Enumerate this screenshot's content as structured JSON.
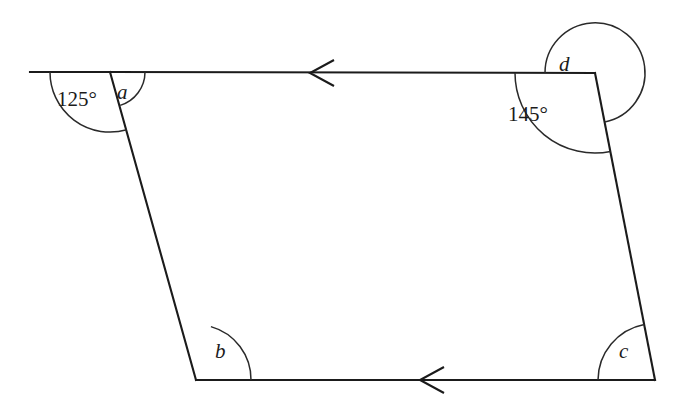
{
  "figure": {
    "kind": "quadrilateral-angle-diagram",
    "canvas": {
      "width": 674,
      "height": 411
    },
    "stroke_color": "#1b1b1b",
    "arc_color": "#2a2a2a",
    "background_color": "#ffffff"
  },
  "labels": {
    "angle_a": "a",
    "angle_b": "b",
    "angle_c": "c",
    "angle_d": "d",
    "angle_top_left_value": "125°",
    "angle_top_right_value": "145°"
  },
  "vertices": {
    "top_left": {
      "x": 110,
      "y": 72
    },
    "top_right": {
      "x": 595,
      "y": 73
    },
    "bottom_right": {
      "x": 655,
      "y": 380
    },
    "bottom_left": {
      "x": 196,
      "y": 380
    },
    "ray_left_end": {
      "x": 30,
      "y": 72
    }
  },
  "markers": {
    "top_edge_arrow_direction": "left",
    "bottom_edge_arrow_direction": "left",
    "top_edge_arrow_at": {
      "x": 320,
      "y": 73
    },
    "bottom_edge_arrow_at": {
      "x": 430,
      "y": 379
    }
  }
}
